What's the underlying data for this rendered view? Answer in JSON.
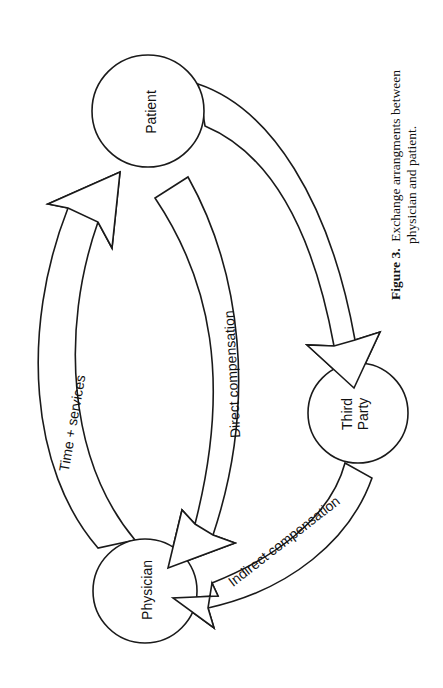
{
  "figure": {
    "nodes": {
      "patient": "Patient",
      "third_party_line1": "Third",
      "third_party_line2": "Party",
      "physician": "Physician"
    },
    "arrows": {
      "time_services": "Time + services",
      "direct_compensation": "Direct compensation",
      "indirect_compensation": "Indirect compensation"
    },
    "caption": {
      "label": "Figure 3.",
      "text_line1": "Exchange arrangments between",
      "text_line2": "physician and patient."
    }
  }
}
